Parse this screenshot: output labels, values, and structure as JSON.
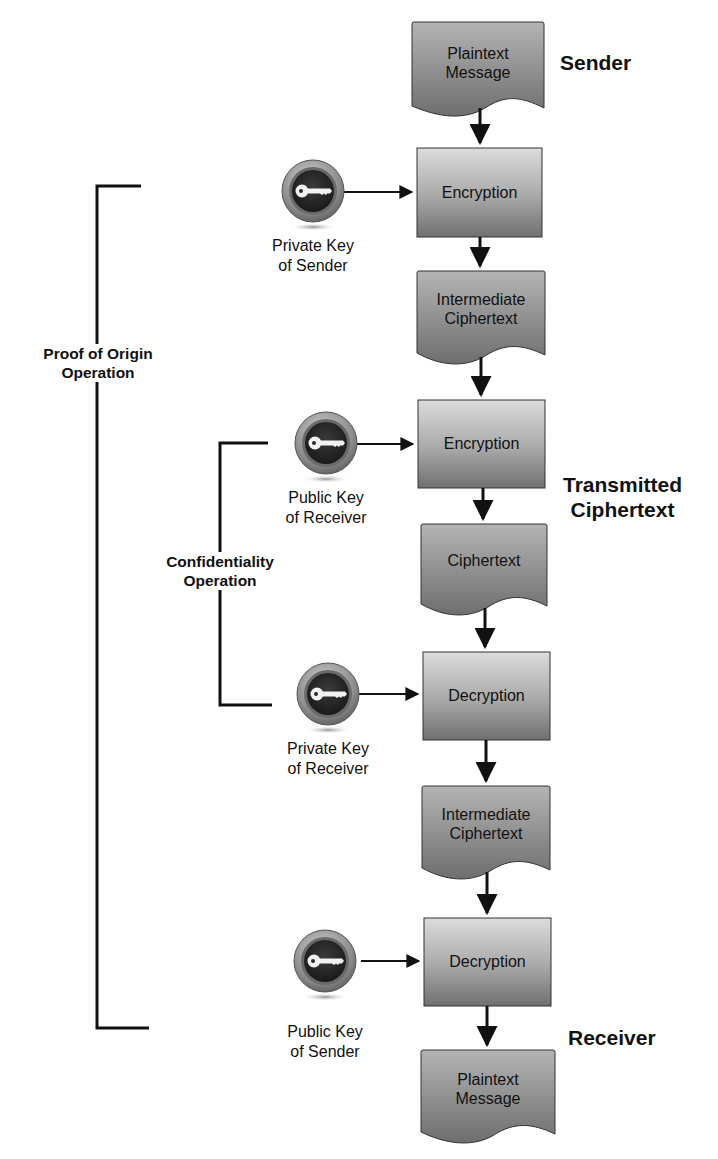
{
  "diagram": {
    "flow": [
      {
        "id": "n1",
        "type": "document",
        "label": [
          "Plaintext",
          "Message"
        ]
      },
      {
        "id": "n2",
        "type": "process",
        "label": [
          "Encryption"
        ]
      },
      {
        "id": "n3",
        "type": "document",
        "label": [
          "Intermediate",
          "Ciphertext"
        ]
      },
      {
        "id": "n4",
        "type": "process",
        "label": [
          "Encryption"
        ]
      },
      {
        "id": "n5",
        "type": "document",
        "label": [
          "Ciphertext"
        ]
      },
      {
        "id": "n6",
        "type": "process",
        "label": [
          "Decryption"
        ]
      },
      {
        "id": "n7",
        "type": "document",
        "label": [
          "Intermediate",
          "Ciphertext"
        ]
      },
      {
        "id": "n8",
        "type": "process",
        "label": [
          "Decryption"
        ]
      },
      {
        "id": "n9",
        "type": "document",
        "label": [
          "Plaintext",
          "Message"
        ]
      }
    ],
    "keys": [
      {
        "icon": "key-icon",
        "label": [
          "Private Key",
          "of Sender"
        ],
        "feeds": "n2"
      },
      {
        "icon": "key-icon",
        "label": [
          "Public Key",
          "of Receiver"
        ],
        "feeds": "n4"
      },
      {
        "icon": "key-icon",
        "label": [
          "Private Key",
          "of Receiver"
        ],
        "feeds": "n6"
      },
      {
        "icon": "key-icon",
        "label": [
          "Public Key",
          "of Sender"
        ],
        "feeds": "n8"
      }
    ],
    "side_labels": {
      "sender": "Sender",
      "transmitted": [
        "Transmitted",
        "Ciphertext"
      ],
      "receiver": "Receiver"
    },
    "brackets": {
      "proof_of_origin": [
        "Proof of Origin",
        "Operation"
      ],
      "confidentiality": [
        "Confidentiality",
        "Operation"
      ]
    },
    "colors": {
      "box_fill_top": "#d9d9d9",
      "box_fill_bottom": "#7a7a7a",
      "line": "#111111",
      "key_dark": "#2b2b2b",
      "key_ring": "#9a9a9a"
    }
  }
}
